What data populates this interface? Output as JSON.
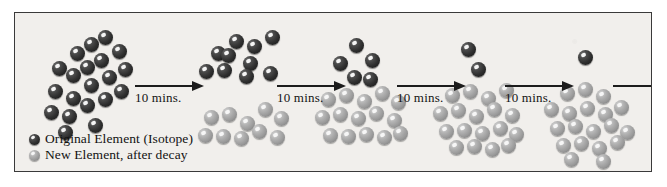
{
  "figure": {
    "background_color": "#f1efec",
    "border_color": "#3a3a3a"
  },
  "legend": {
    "items": [
      {
        "key": "original",
        "label": "Original Element (Isotope)",
        "swatch": "dark-sphere-icon",
        "color": "#2e2e2e"
      },
      {
        "key": "new",
        "label": "New Element, after decay",
        "swatch": "light-sphere-icon",
        "color": "#a0a0a0"
      }
    ]
  },
  "steps": [
    {
      "label": "10 mins."
    },
    {
      "label": "10 mins."
    },
    {
      "label": "10 mins."
    },
    {
      "label": "10 mins."
    },
    {
      "label": ""
    }
  ],
  "chart_data": {
    "type": "scatter",
    "xlabel": "Elapsed time",
    "ylabel": "Atom count",
    "categories": [
      "0 mins",
      "10 mins",
      "20 mins",
      "30 mins",
      "40 mins"
    ],
    "series": [
      {
        "name": "Original Element (Isotope)",
        "values": [
          20,
          10,
          5,
          2,
          1
        ]
      },
      {
        "name": "New Element, after decay",
        "values": [
          0,
          10,
          15,
          18,
          19
        ]
      }
    ],
    "total_atoms": 20,
    "half_life_minutes": 10,
    "annotations": [
      "10 mins.",
      "10 mins.",
      "10 mins.",
      "10 mins."
    ],
    "legend_position": "bottom-left",
    "grid": false
  },
  "clusters": [
    {
      "name": "cluster-0-min",
      "dark": [
        [
          44,
          55
        ],
        [
          62,
          40
        ],
        [
          58,
          62
        ],
        [
          76,
          31
        ],
        [
          72,
          54
        ],
        [
          90,
          24
        ],
        [
          86,
          47
        ],
        [
          104,
          38
        ],
        [
          40,
          78
        ],
        [
          58,
          85
        ],
        [
          76,
          72
        ],
        [
          94,
          64
        ],
        [
          110,
          56
        ],
        [
          36,
          99
        ],
        [
          54,
          103
        ],
        [
          72,
          92
        ],
        [
          90,
          86
        ],
        [
          106,
          78
        ],
        [
          50,
          119
        ],
        [
          80,
          112
        ]
      ],
      "light": []
    },
    {
      "name": "cluster-10-min",
      "dark": [
        [
          203,
          40
        ],
        [
          221,
          28
        ],
        [
          239,
          33
        ],
        [
          257,
          24
        ],
        [
          235,
          50
        ],
        [
          191,
          58
        ],
        [
          209,
          57
        ],
        [
          231,
          63
        ],
        [
          255,
          60
        ],
        [
          213,
          42
        ]
      ],
      "light": [
        [
          196,
          104
        ],
        [
          214,
          101
        ],
        [
          232,
          110
        ],
        [
          250,
          96
        ],
        [
          266,
          105
        ],
        [
          190,
          122
        ],
        [
          208,
          123
        ],
        [
          226,
          125
        ],
        [
          244,
          118
        ],
        [
          262,
          124
        ]
      ]
    },
    {
      "name": "cluster-20-min",
      "dark": [
        [
          341,
          32
        ],
        [
          325,
          50
        ],
        [
          357,
          47
        ],
        [
          339,
          64
        ],
        [
          355,
          66
        ]
      ],
      "light": [
        [
          313,
          86
        ],
        [
          331,
          82
        ],
        [
          349,
          88
        ],
        [
          367,
          80
        ],
        [
          383,
          89
        ],
        [
          307,
          104
        ],
        [
          325,
          101
        ],
        [
          343,
          105
        ],
        [
          361,
          100
        ],
        [
          379,
          107
        ],
        [
          315,
          122
        ],
        [
          333,
          123
        ],
        [
          351,
          121
        ],
        [
          369,
          124
        ],
        [
          385,
          120
        ]
      ]
    },
    {
      "name": "cluster-30-min",
      "dark": [
        [
          453,
          36
        ],
        [
          463,
          56
        ]
      ],
      "light": [
        [
          437,
          82
        ],
        [
          455,
          78
        ],
        [
          473,
          85
        ],
        [
          491,
          77
        ],
        [
          425,
          100
        ],
        [
          443,
          97
        ],
        [
          461,
          103
        ],
        [
          479,
          96
        ],
        [
          497,
          102
        ],
        [
          431,
          118
        ],
        [
          449,
          117
        ],
        [
          467,
          120
        ],
        [
          485,
          115
        ],
        [
          501,
          121
        ],
        [
          441,
          134
        ],
        [
          459,
          133
        ],
        [
          477,
          136
        ],
        [
          493,
          132
        ]
      ]
    },
    {
      "name": "cluster-40-min",
      "dark": [
        [
          570,
          44
        ]
      ],
      "light": [
        [
          552,
          80
        ],
        [
          570,
          76
        ],
        [
          588,
          83
        ],
        [
          536,
          96
        ],
        [
          554,
          100
        ],
        [
          572,
          95
        ],
        [
          590,
          101
        ],
        [
          606,
          94
        ],
        [
          542,
          115
        ],
        [
          560,
          113
        ],
        [
          578,
          118
        ],
        [
          596,
          112
        ],
        [
          612,
          119
        ],
        [
          548,
          132
        ],
        [
          566,
          130
        ],
        [
          584,
          135
        ],
        [
          602,
          129
        ],
        [
          556,
          146
        ],
        [
          588,
          148
        ]
      ]
    }
  ],
  "arrows": [
    {
      "name": "arrow-0",
      "x": 120,
      "y": 72,
      "width": 68,
      "label_x": 122,
      "label_y": 77
    },
    {
      "name": "arrow-1",
      "x": 262,
      "y": 72,
      "width": 68,
      "label_x": 264,
      "label_y": 77
    },
    {
      "name": "arrow-2",
      "x": 382,
      "y": 72,
      "width": 68,
      "label_x": 384,
      "label_y": 77
    },
    {
      "name": "arrow-3",
      "x": 490,
      "y": 72,
      "width": 68,
      "label_x": 492,
      "label_y": 77
    },
    {
      "name": "arrow-4",
      "x": 598,
      "y": 72,
      "width": 52,
      "label_x": 0,
      "label_y": 0
    }
  ]
}
